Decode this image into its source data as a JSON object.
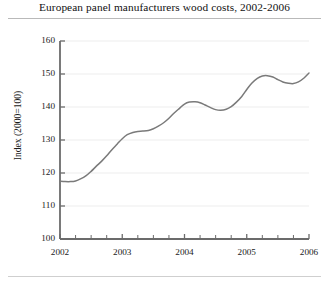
{
  "figure": {
    "title": "European panel manufacturers wood costs, 2002-2006",
    "has_top_rule": true,
    "has_bottom_rule": true,
    "background": "#ffffff",
    "line_color": "#7a7a7a",
    "axis_color": "#6b6b6b",
    "grid_color": "#ededed"
  },
  "chart_data": {
    "type": "line",
    "title": "European panel manufacturers wood costs, 2002-2006",
    "xlabel": "",
    "ylabel": "Index (2000=100)",
    "xlim": [
      2002,
      2006
    ],
    "ylim": [
      100,
      160
    ],
    "grid": true,
    "legend": false,
    "y_ticks": [
      100,
      110,
      120,
      130,
      140,
      150,
      160
    ],
    "y_tick_labels": [
      "100",
      "110",
      "120",
      "130",
      "140",
      "150",
      "160"
    ],
    "x_ticks": [
      2002,
      2003,
      2004,
      2005,
      2006
    ],
    "x_tick_labels": [
      "2002",
      "2003",
      "2004",
      "2005",
      "2006"
    ],
    "x_minor_ticks": [
      2002.25,
      2002.5,
      2002.75,
      2003.25,
      2003.5,
      2003.75,
      2004.25,
      2004.5,
      2004.75,
      2005.25,
      2005.5,
      2005.75
    ],
    "series": [
      {
        "name": "Wood cost index",
        "color": "#7a7a7a",
        "x": [
          2002.0,
          2002.08,
          2002.17,
          2002.25,
          2002.33,
          2002.42,
          2002.5,
          2002.58,
          2002.67,
          2002.75,
          2002.83,
          2002.92,
          2003.0,
          2003.08,
          2003.17,
          2003.25,
          2003.33,
          2003.42,
          2003.5,
          2003.58,
          2003.67,
          2003.75,
          2003.83,
          2003.92,
          2004.0,
          2004.08,
          2004.17,
          2004.25,
          2004.33,
          2004.42,
          2004.5,
          2004.58,
          2004.67,
          2004.75,
          2004.83,
          2004.92,
          2005.0,
          2005.08,
          2005.17,
          2005.25,
          2005.33,
          2005.42,
          2005.5,
          2005.58,
          2005.67,
          2005.75,
          2005.83,
          2005.92,
          2006.0
        ],
        "y": [
          117.5,
          117.4,
          117.4,
          117.6,
          118.2,
          119.2,
          120.5,
          122.0,
          123.6,
          125.2,
          127.0,
          128.8,
          130.4,
          131.6,
          132.3,
          132.6,
          132.7,
          132.9,
          133.4,
          134.2,
          135.3,
          136.6,
          138.1,
          139.6,
          140.9,
          141.5,
          141.6,
          141.3,
          140.6,
          139.8,
          139.2,
          139.0,
          139.3,
          140.1,
          141.4,
          143.2,
          145.3,
          147.2,
          148.7,
          149.4,
          149.5,
          149.1,
          148.3,
          147.6,
          147.2,
          147.1,
          147.6,
          148.8,
          150.3
        ],
        "end_value": 151.7
      }
    ],
    "annotations": []
  }
}
